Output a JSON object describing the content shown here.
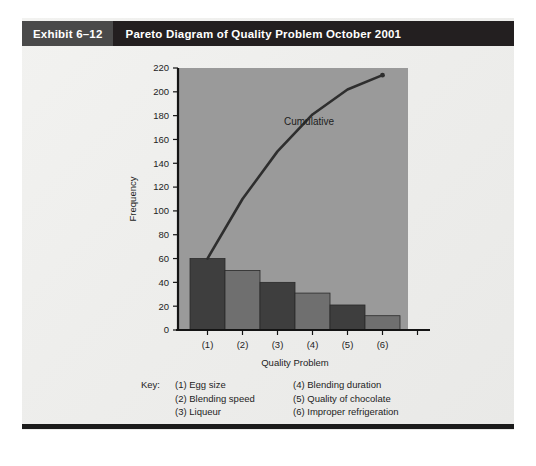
{
  "header": {
    "exhibit_number": "Exhibit 6–12",
    "title": "Pareto Diagram of Quality Problem October 2001"
  },
  "colors": {
    "header_bar": "#231f20",
    "header_number_block": "#4a4a4a",
    "plot_background": "#9a9a9a",
    "bar_dark": "#3e3e3e",
    "bar_light": "#6f6f6f",
    "curve": "#2e2e2e",
    "axis": "#141414",
    "panel": "#eeeeec"
  },
  "chart_data": {
    "type": "bar",
    "title": "Pareto Diagram of Quality Problem October 2001",
    "xlabel": "Quality Problem",
    "ylabel": "Frequency",
    "categories": [
      "(1)",
      "(2)",
      "(3)",
      "(4)",
      "(5)",
      "(6)"
    ],
    "values": [
      60,
      50,
      40,
      31,
      21,
      12
    ],
    "ylim": [
      0,
      220
    ],
    "ytick_step": 20,
    "yticks": [
      0,
      20,
      40,
      60,
      80,
      100,
      120,
      140,
      160,
      180,
      200,
      220
    ],
    "ytick_labels": [
      "0",
      "20",
      "40",
      "60",
      "80",
      "100",
      "120",
      "140",
      "160",
      "180",
      "200",
      "220"
    ],
    "grid": false,
    "legend_position": "none",
    "series": [
      {
        "name": "Frequency",
        "type": "bar",
        "values": [
          60,
          50,
          40,
          31,
          21,
          12
        ]
      },
      {
        "name": "Cumulative",
        "type": "line",
        "values": [
          60,
          110,
          150,
          181,
          202,
          214
        ],
        "annotation": "Cumulative"
      }
    ],
    "annotations": [
      {
        "text": "Cumulative",
        "x": "(4)",
        "y": 172
      }
    ]
  },
  "key": {
    "label": "Key:",
    "column1": [
      "(1) Egg size",
      "(2) Blending speed",
      "(3) Liqueur"
    ],
    "column2": [
      "(4) Blending duration",
      "(5) Quality of chocolate",
      "(6) Improper refrigeration"
    ]
  }
}
